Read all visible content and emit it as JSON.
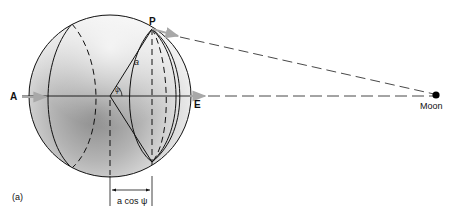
{
  "figure": {
    "panel_label": "(a)",
    "labels": {
      "point_p": "P",
      "point_a": "A",
      "point_e": "E",
      "moon": "Moon",
      "radius": "a",
      "angle": "ψ",
      "projection": "a cos ψ"
    },
    "colors": {
      "line": "#111111",
      "arrow_gray": "#a8a8a8",
      "sphere_light": "#f2f2f2",
      "sphere_dark": "#8c8c8c",
      "moon": "#000000"
    },
    "elements": [
      "Earth sphere with shading",
      "meridian circles (solid and dashed)",
      "equatorial axis from A to E",
      "point P on sphere surface",
      "radius a from center to P at angle ψ",
      "projection distance a cos ψ",
      "dashed lines from P and E to the Moon"
    ]
  }
}
